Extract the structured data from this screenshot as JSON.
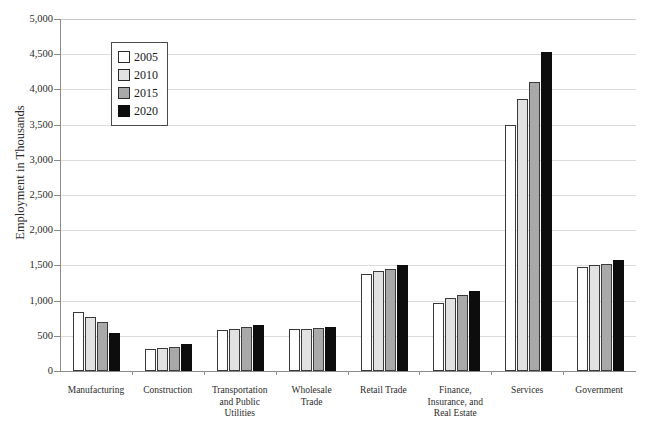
{
  "chart_data": {
    "type": "bar",
    "title": "",
    "xlabel": "",
    "ylabel": "Employment in Thousands",
    "ylim": [
      0,
      5000
    ],
    "ytick_step": 500,
    "yticks": [
      "5,000",
      "4,500",
      "4,000",
      "3,500",
      "3,000",
      "2,500",
      "2,000",
      "1,500",
      "1,000",
      "500",
      "0"
    ],
    "grid": true,
    "legend_position": "top-left",
    "categories": [
      "Manufacturing",
      "Construction",
      "Transportation and Public Utilities",
      "Wholesale Trade",
      "Retail Trade",
      "Finance, Insurance, and Real Estate",
      "Services",
      "Government"
    ],
    "category_lines": [
      [
        "Manufacturing"
      ],
      [
        "Construction"
      ],
      [
        "Transportation",
        "and Public",
        "Utilities"
      ],
      [
        "Wholesale",
        "Trade"
      ],
      [
        "Retail Trade"
      ],
      [
        "Finance,",
        "Insurance, and",
        "Real Estate"
      ],
      [
        "Services"
      ],
      [
        "Government"
      ]
    ],
    "series": [
      {
        "name": "2005",
        "color": "#ffffff",
        "values": [
          840,
          310,
          580,
          590,
          1380,
          970,
          3500,
          1480
        ]
      },
      {
        "name": "2010",
        "color": "#e2e2e2",
        "values": [
          770,
          320,
          600,
          600,
          1420,
          1040,
          3870,
          1500
        ]
      },
      {
        "name": "2015",
        "color": "#a9a9a9",
        "values": [
          700,
          340,
          620,
          610,
          1450,
          1080,
          4100,
          1520
        ]
      },
      {
        "name": "2020",
        "color": "#0d0d0d",
        "values": [
          540,
          380,
          650,
          630,
          1500,
          1140,
          4530,
          1570
        ]
      }
    ]
  },
  "legend": {
    "items": [
      {
        "label": "2005"
      },
      {
        "label": "2010"
      },
      {
        "label": "2015"
      },
      {
        "label": "2020"
      }
    ]
  }
}
